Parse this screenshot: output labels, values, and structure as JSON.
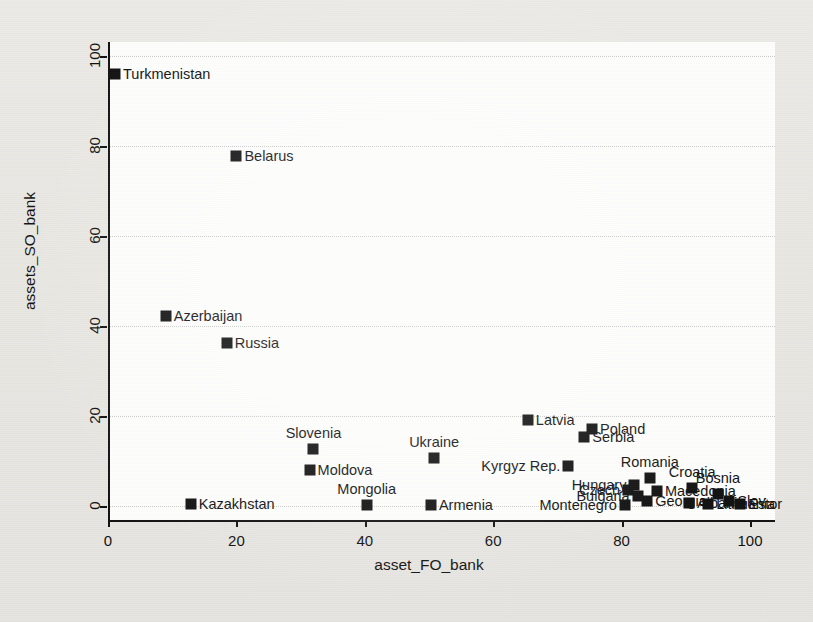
{
  "figure": {
    "background_color": "#e8e7e2",
    "plot_background_color": "#fdfdfc",
    "marker_color": "#111111",
    "grid_color": "#c9c9c9"
  },
  "chart_data": {
    "type": "scatter",
    "title": "",
    "xlabel": "asset_FO_bank",
    "ylabel": "assets_SO_bank",
    "xlim": [
      -3,
      105
    ],
    "ylim": [
      -2,
      104
    ],
    "xticks": [
      0,
      20,
      40,
      60,
      80,
      100
    ],
    "yticks": [
      0,
      20,
      40,
      60,
      80,
      100
    ],
    "xticklabels": [
      "0",
      "20",
      "40",
      "60",
      "80",
      "100"
    ],
    "yticklabels": [
      "0",
      "20",
      "40",
      "60",
      "80",
      "100"
    ],
    "grid": "horizontal-dotted",
    "legend": "none",
    "marker_style": "filled-square",
    "points": [
      {
        "label": "Turkmenistan",
        "x": 1.1,
        "y": 96.0,
        "label_pos": "right"
      },
      {
        "label": "Belarus",
        "x": 20.0,
        "y": 77.8,
        "label_pos": "right"
      },
      {
        "label": "Azerbaijan",
        "x": 9.0,
        "y": 42.2,
        "label_pos": "right"
      },
      {
        "label": "Russia",
        "x": 18.5,
        "y": 36.2,
        "label_pos": "right"
      },
      {
        "label": "Latvia",
        "x": 65.4,
        "y": 19.1,
        "label_pos": "right"
      },
      {
        "label": "Poland",
        "x": 75.4,
        "y": 17.1,
        "label_pos": "right"
      },
      {
        "label": "Serbia",
        "x": 74.2,
        "y": 15.3,
        "label_pos": "right"
      },
      {
        "label": "Ukraine",
        "x": 50.8,
        "y": 10.7,
        "label_pos": "above"
      },
      {
        "label": "Kyrgyz Rep.",
        "x": 71.7,
        "y": 8.9,
        "label_pos": "left"
      },
      {
        "label": "Moldova",
        "x": 31.4,
        "y": 8.0,
        "label_pos": "right"
      },
      {
        "label": "Slovenia",
        "x": 32.0,
        "y": 12.6,
        "label_pos": "above"
      },
      {
        "label": "Romania",
        "x": 84.4,
        "y": 6.2,
        "label_pos": "above"
      },
      {
        "label": "Hungary",
        "x": 82.0,
        "y": 4.6,
        "label_pos": "left"
      },
      {
        "label": "Croatia",
        "x": 91.0,
        "y": 4.0,
        "label_pos": "above"
      },
      {
        "label": "Czech",
        "x": 81.0,
        "y": 3.6,
        "label_pos": "left"
      },
      {
        "label": "Macedonia",
        "x": 85.5,
        "y": 3.4,
        "label_pos": "right"
      },
      {
        "label": "Bosnia",
        "x": 95.0,
        "y": 2.6,
        "label_pos": "above"
      },
      {
        "label": "Bulgaria",
        "x": 82.5,
        "y": 2.2,
        "label_pos": "left"
      },
      {
        "label": "Georgia",
        "x": 84.0,
        "y": 1.2,
        "label_pos": "right"
      },
      {
        "label": "Slov",
        "x": 96.8,
        "y": 1.1,
        "label_pos": "right"
      },
      {
        "label": "Montenegro",
        "x": 80.5,
        "y": 0.2,
        "label_pos": "left"
      },
      {
        "label": "Albania",
        "x": 90.5,
        "y": 0.6,
        "label_pos": "right"
      },
      {
        "label": "Lithuania",
        "x": 93.5,
        "y": 0.5,
        "label_pos": "right"
      },
      {
        "label": "Estor",
        "x": 98.5,
        "y": 0.4,
        "label_pos": "right"
      },
      {
        "label": "Mongolia",
        "x": 40.3,
        "y": 0.3,
        "label_pos": "above"
      },
      {
        "label": "Armenia",
        "x": 50.3,
        "y": 0.2,
        "label_pos": "right"
      },
      {
        "label": "Kazakhstan",
        "x": 12.9,
        "y": 0.4,
        "label_pos": "right"
      }
    ]
  }
}
